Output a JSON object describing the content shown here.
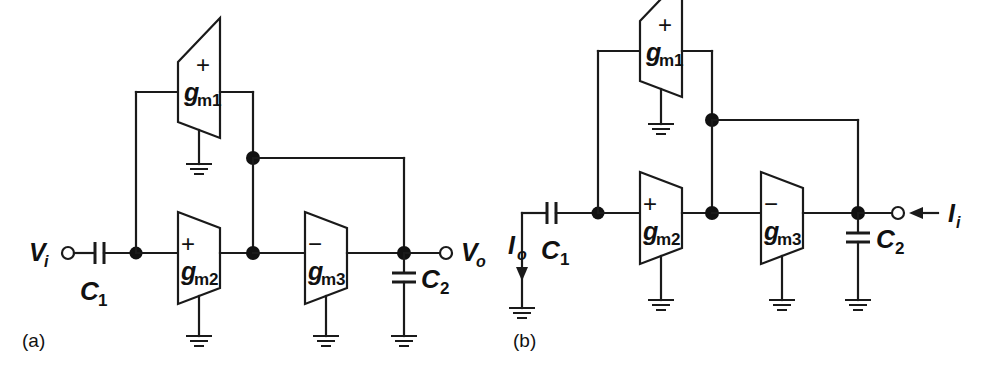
{
  "figure": {
    "type": "circuit-schematic",
    "background_color": "#ffffff",
    "line_color": "#1a1a1a"
  },
  "panels": [
    {
      "id": "a",
      "label": "(a)",
      "amplifiers": [
        {
          "id": "gm1",
          "name": "g",
          "subscript": "m1",
          "sign": "+",
          "orientation": "right-to-left"
        },
        {
          "id": "gm2",
          "name": "g",
          "subscript": "m2",
          "sign": "+",
          "orientation": "left-to-right"
        },
        {
          "id": "gm3",
          "name": "g",
          "subscript": "m3",
          "sign": "−",
          "orientation": "left-to-right"
        }
      ],
      "capacitors": [
        {
          "id": "C1",
          "name": "C",
          "subscript": "1",
          "orientation": "horizontal"
        },
        {
          "id": "C2",
          "name": "C",
          "subscript": "2",
          "orientation": "vertical"
        }
      ],
      "terminals": [
        {
          "id": "Vi",
          "name": "V",
          "subscript": "i",
          "kind": "input",
          "side": "left"
        },
        {
          "id": "Vo",
          "name": "V",
          "subscript": "o",
          "kind": "output",
          "side": "right"
        }
      ],
      "ground_count": 3
    },
    {
      "id": "b",
      "label": "(b)",
      "amplifiers": [
        {
          "id": "gm1",
          "name": "g",
          "subscript": "m1",
          "sign": "+",
          "orientation": "right-to-left"
        },
        {
          "id": "gm2",
          "name": "g",
          "subscript": "m2",
          "sign": "+",
          "orientation": "left-to-right"
        },
        {
          "id": "gm3",
          "name": "g",
          "subscript": "m3",
          "sign": "−",
          "orientation": "left-to-right"
        }
      ],
      "capacitors": [
        {
          "id": "C1",
          "name": "C",
          "subscript": "1",
          "orientation": "horizontal"
        },
        {
          "id": "C2",
          "name": "C",
          "subscript": "2",
          "orientation": "vertical"
        }
      ],
      "terminals": [
        {
          "id": "Io",
          "name": "I",
          "subscript": "o",
          "kind": "output-current",
          "side": "left",
          "arrow": "down"
        },
        {
          "id": "Ii",
          "name": "I",
          "subscript": "i",
          "kind": "input-current",
          "side": "right",
          "arrow": "left"
        }
      ],
      "ground_count": 5
    }
  ],
  "labels": {
    "a": {
      "panel": "(a)",
      "gm1": "g",
      "gm1_sub": "m1",
      "gm1_sign": "+",
      "gm2": "g",
      "gm2_sub": "m2",
      "gm2_sign": "+",
      "gm3": "g",
      "gm3_sub": "m3",
      "gm3_sign": "−",
      "c1": "C",
      "c1_sub": "1",
      "c2": "C",
      "c2_sub": "2",
      "vi": "V",
      "vi_sub": "i",
      "vo": "V",
      "vo_sub": "o"
    },
    "b": {
      "panel": "(b)",
      "gm1": "g",
      "gm1_sub": "m1",
      "gm1_sign": "+",
      "gm2": "g",
      "gm2_sub": "m2",
      "gm2_sign": "+",
      "gm3": "g",
      "gm3_sub": "m3",
      "gm3_sign": "−",
      "c1": "C",
      "c1_sub": "1",
      "c2": "C",
      "c2_sub": "2",
      "io": "I",
      "io_sub": "o",
      "ii": "I",
      "ii_sub": "i"
    }
  }
}
